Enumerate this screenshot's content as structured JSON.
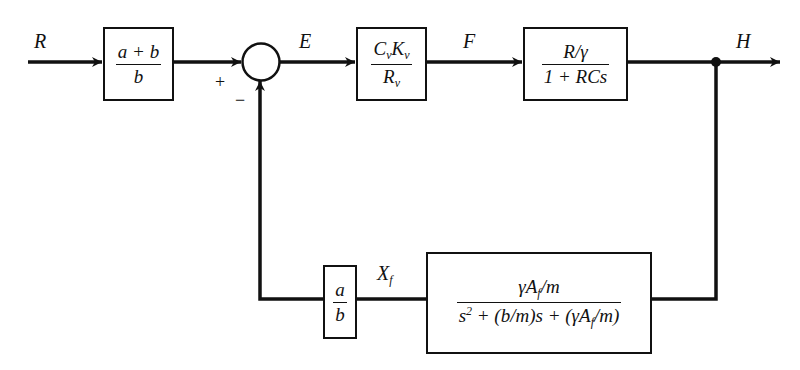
{
  "diagram": {
    "type": "block-diagram",
    "signals": {
      "input": "R",
      "error": "E",
      "intermediate": "F",
      "output": "H",
      "feedback": "X",
      "feedback_sub": "f"
    },
    "summing_junction": {
      "plus_sign": "+",
      "minus_sign": "−"
    },
    "blocks": {
      "prefilter": {
        "num": "a + b",
        "den": "b"
      },
      "valve": {
        "num_C": "C",
        "num_v1": "v",
        "num_K": "K",
        "num_v2": "v",
        "den_R": "R",
        "den_v": "v"
      },
      "tank": {
        "num": "R/γ",
        "den": "1 + RCs"
      },
      "actuator": {
        "num_pre": "γA",
        "num_sub": "f",
        "num_post": "/m",
        "den_s": "s",
        "den_exp": "2",
        "den_mid": " + (b/m)s + (γA",
        "den_sub": "f",
        "den_post": "/m)"
      },
      "feedback_gain": {
        "num": "a",
        "den": "b"
      }
    }
  }
}
